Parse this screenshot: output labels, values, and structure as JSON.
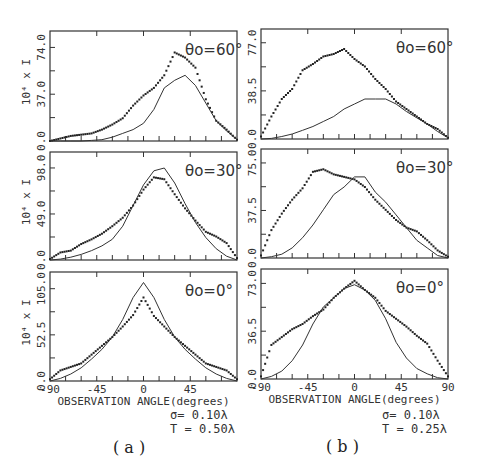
{
  "chart_data": [
    {
      "type": "line",
      "panel": "a",
      "row": 0,
      "annotation": "θo=60°",
      "ylabel": "10⁴ x I",
      "xlabel": "",
      "ylim": [
        0,
        87
      ],
      "yticks": [
        "0.0",
        "37.0",
        "74.0"
      ],
      "x": [
        -90,
        -80,
        -70,
        -60,
        -50,
        -40,
        -30,
        -20,
        -10,
        0,
        10,
        20,
        30,
        40,
        50,
        60,
        70,
        80,
        90
      ],
      "series": [
        {
          "name": "dots",
          "style": "dotted",
          "values": [
            0,
            2,
            4,
            5,
            6,
            9,
            13,
            18,
            28,
            36,
            42,
            52,
            70,
            66,
            58,
            33,
            16,
            9,
            1
          ]
        },
        {
          "name": "solid",
          "style": "solid",
          "values": [
            0,
            0,
            0,
            0,
            0.5,
            1,
            3,
            6,
            9,
            14,
            25,
            42,
            48,
            52,
            44,
            30,
            16,
            8,
            1
          ]
        }
      ]
    },
    {
      "type": "line",
      "panel": "a",
      "row": 1,
      "annotation": "θo=30°",
      "ylabel": "10⁴ x I",
      "xlabel": "",
      "ylim": [
        0,
        115
      ],
      "yticks": [
        "0.0",
        "49.0",
        "98.0"
      ],
      "x": [
        -90,
        -80,
        -70,
        -60,
        -50,
        -40,
        -30,
        -20,
        -10,
        0,
        10,
        20,
        30,
        40,
        50,
        60,
        70,
        80,
        90
      ],
      "series": [
        {
          "name": "dots",
          "style": "dotted",
          "values": [
            1,
            8,
            10,
            17,
            22,
            28,
            36,
            45,
            58,
            75,
            88,
            86,
            70,
            55,
            42,
            30,
            25,
            18,
            2
          ]
        },
        {
          "name": "solid",
          "style": "solid",
          "values": [
            0,
            1,
            3,
            6,
            10,
            15,
            22,
            36,
            58,
            80,
            95,
            98,
            82,
            60,
            40,
            24,
            12,
            4,
            0
          ]
        }
      ]
    },
    {
      "type": "line",
      "panel": "a",
      "row": 2,
      "annotation": "θo=0°",
      "ylabel": "10⁴ x I",
      "xlabel": "OBSERVATION ANGLE(degrees)",
      "ylim": [
        0,
        124
      ],
      "yticks": [
        "0.0",
        "52.5",
        "105.0"
      ],
      "xticks": [
        "-90",
        "-45",
        "0",
        "45"
      ],
      "x": [
        -90,
        -80,
        -70,
        -60,
        -50,
        -40,
        -30,
        -20,
        -10,
        0,
        10,
        20,
        30,
        40,
        50,
        60,
        70,
        80,
        90
      ],
      "series": [
        {
          "name": "dots",
          "style": "dotted",
          "values": [
            2,
            12,
            16,
            20,
            30,
            40,
            50,
            62,
            75,
            95,
            74,
            62,
            50,
            40,
            30,
            20,
            16,
            12,
            2
          ]
        },
        {
          "name": "solid",
          "style": "solid",
          "values": [
            0,
            3,
            8,
            15,
            25,
            36,
            50,
            70,
            95,
            112,
            95,
            70,
            50,
            36,
            25,
            15,
            8,
            3,
            0
          ]
        }
      ]
    },
    {
      "type": "line",
      "panel": "b",
      "row": 0,
      "annotation": "θo=60°",
      "ylabel": "",
      "xlabel": "",
      "ylim": [
        0,
        88
      ],
      "yticks": [
        "0.0",
        "38.5",
        "77.0"
      ],
      "x": [
        -90,
        -80,
        -70,
        -60,
        -50,
        -40,
        -30,
        -20,
        -10,
        0,
        10,
        20,
        30,
        40,
        50,
        60,
        70,
        80,
        90
      ],
      "series": [
        {
          "name": "dots",
          "style": "dotted",
          "values": [
            2,
            18,
            32,
            40,
            55,
            60,
            66,
            68,
            72,
            64,
            58,
            48,
            40,
            30,
            24,
            18,
            12,
            8,
            1
          ]
        },
        {
          "name": "solid",
          "style": "solid",
          "values": [
            0,
            0.5,
            2,
            4,
            7,
            10,
            14,
            18,
            24,
            28,
            32,
            32,
            32,
            28,
            22,
            17,
            12,
            6,
            1
          ]
        }
      ]
    },
    {
      "type": "line",
      "panel": "b",
      "row": 1,
      "annotation": "θo=30°",
      "ylabel": "",
      "xlabel": "",
      "ylim": [
        0,
        86
      ],
      "yticks": [
        "0.0",
        "37.5",
        "75.0"
      ],
      "x": [
        -90,
        -80,
        -70,
        -60,
        -50,
        -40,
        -30,
        -20,
        -10,
        0,
        10,
        20,
        30,
        40,
        50,
        60,
        70,
        80,
        90
      ],
      "series": [
        {
          "name": "dots",
          "style": "dotted",
          "values": [
            2,
            22,
            35,
            46,
            55,
            68,
            70,
            66,
            64,
            62,
            56,
            46,
            38,
            30,
            24,
            21,
            14,
            6,
            1
          ]
        },
        {
          "name": "solid",
          "style": "solid",
          "values": [
            0,
            1,
            3,
            8,
            16,
            26,
            38,
            50,
            56,
            64,
            64,
            52,
            44,
            34,
            24,
            14,
            8,
            2,
            0
          ]
        }
      ]
    },
    {
      "type": "line",
      "panel": "b",
      "row": 2,
      "annotation": "θo=0°",
      "ylabel": "",
      "xlabel": "OBSERVATION ANGLE(degrees)",
      "ylim": [
        0,
        84
      ],
      "yticks": [
        "0.0",
        "36.5",
        "73.0"
      ],
      "xticks": [
        "-90",
        "-45",
        "0",
        "45",
        "90"
      ],
      "x": [
        -90,
        -80,
        -70,
        -60,
        -50,
        -40,
        -30,
        -20,
        -10,
        0,
        10,
        20,
        30,
        40,
        50,
        60,
        70,
        80,
        90
      ],
      "series": [
        {
          "name": "dots",
          "style": "dotted",
          "values": [
            2,
            26,
            32,
            38,
            42,
            48,
            53,
            62,
            69,
            75,
            68,
            62,
            52,
            46,
            40,
            33,
            27,
            14,
            2
          ]
        },
        {
          "name": "solid",
          "style": "solid",
          "values": [
            0,
            2,
            6,
            14,
            26,
            42,
            55,
            62,
            69,
            72,
            68,
            60,
            46,
            28,
            16,
            8,
            4,
            1,
            0
          ]
        }
      ]
    }
  ],
  "captions": {
    "a": {
      "sigma": "σ= 0.10λ",
      "T": "T = 0.50λ",
      "label": "( a )"
    },
    "b": {
      "sigma": "σ= 0.10λ",
      "T": "T = 0.25λ",
      "label": "( b )"
    }
  }
}
